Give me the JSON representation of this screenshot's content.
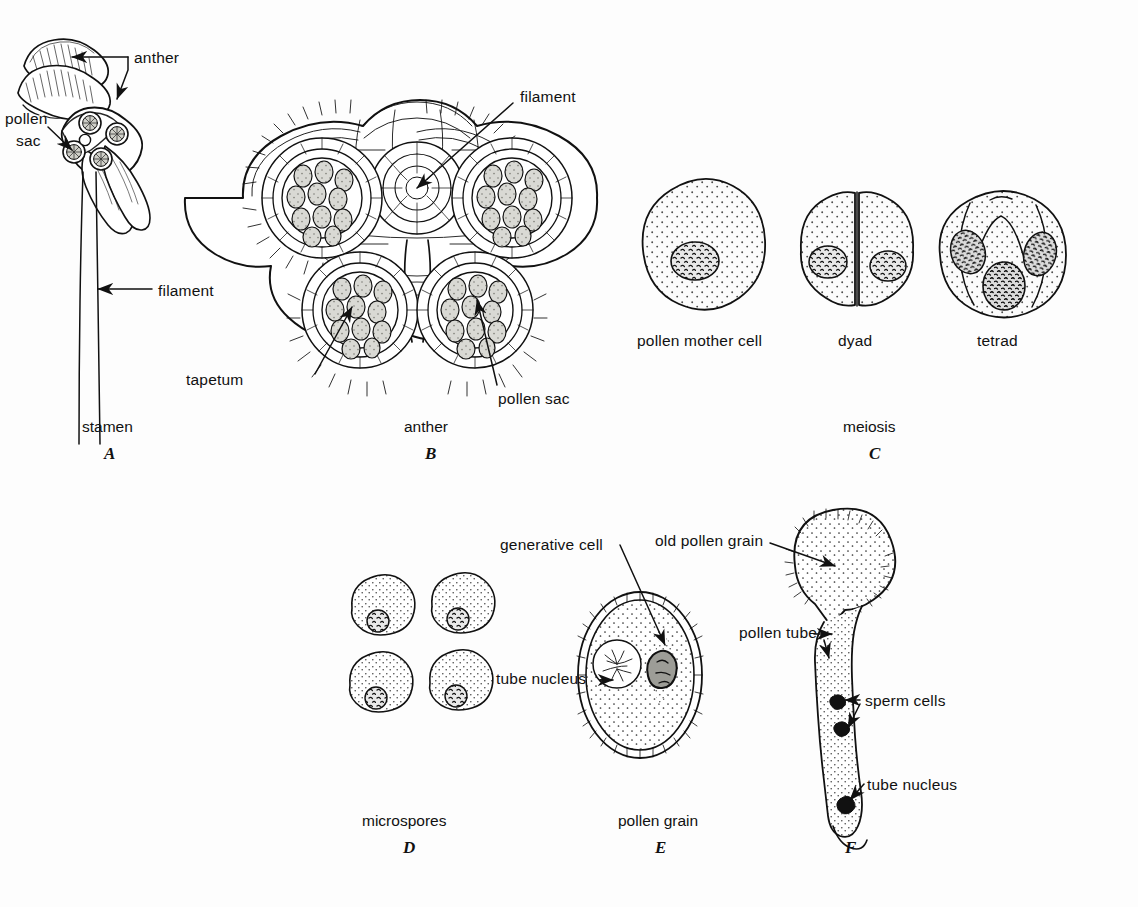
{
  "figure": {
    "background": "#fdfdfd",
    "ink": "#111111",
    "title_implied": "Microsporogenesis and pollen development in an angiosperm",
    "width": 1138,
    "height": 907
  },
  "panels": [
    {
      "id": "A",
      "letter": "A",
      "caption": "stamen",
      "caption_pos": {
        "x": 82,
        "y": 418
      },
      "letter_pos": {
        "x": 104,
        "y": 446
      },
      "callouts": [
        {
          "name": "anther",
          "text": "anther",
          "x": 134,
          "y": 49
        },
        {
          "name": "pollen-sac",
          "text": "pollen",
          "x": 5,
          "y": 110
        },
        {
          "name": "pollen-sac-2",
          "text": "sac",
          "x": 16,
          "y": 130
        },
        {
          "name": "filament",
          "text": "filament",
          "x": 158,
          "y": 282
        }
      ]
    },
    {
      "id": "B",
      "letter": "B",
      "caption": "anther",
      "caption_pos": {
        "x": 404,
        "y": 418
      },
      "letter_pos": {
        "x": 425,
        "y": 446
      },
      "callouts": [
        {
          "name": "filament",
          "text": "filament",
          "x": 520,
          "y": 88
        },
        {
          "name": "tapetum",
          "text": "tapetum",
          "x": 259,
          "y": 378
        },
        {
          "name": "pollen-sac",
          "text": "pollen sac",
          "x": 500,
          "y": 391
        }
      ]
    },
    {
      "id": "C",
      "letter": "C",
      "caption": "meiosis",
      "caption_pos": {
        "x": 843,
        "y": 418
      },
      "letter_pos": {
        "x": 869,
        "y": 446
      },
      "stages": [
        {
          "name": "pollen-mother-cell",
          "label": "pollen mother cell",
          "x": 640,
          "y": 330
        },
        {
          "name": "dyad",
          "label": "dyad",
          "x": 838,
          "y": 330
        },
        {
          "name": "tetrad",
          "label": "tetrad",
          "x": 975,
          "y": 330
        }
      ]
    },
    {
      "id": "D",
      "letter": "D",
      "caption": "microspores",
      "caption_pos": {
        "x": 362,
        "y": 812
      },
      "letter_pos": {
        "x": 403,
        "y": 840
      },
      "callouts": []
    },
    {
      "id": "E",
      "letter": "E",
      "caption": "pollen grain",
      "caption_pos": {
        "x": 618,
        "y": 812
      },
      "letter_pos": {
        "x": 655,
        "y": 840
      },
      "callouts": [
        {
          "name": "generative-cell",
          "text": "generative cell",
          "x": 500,
          "y": 536
        },
        {
          "name": "tube-nucleus",
          "text": "tube nucleus",
          "x": 496,
          "y": 673
        }
      ]
    },
    {
      "id": "F",
      "letter": "F",
      "caption": "",
      "caption_pos": {
        "x": 0,
        "y": 0
      },
      "letter_pos": {
        "x": 845,
        "y": 840
      },
      "callouts": [
        {
          "name": "old-pollen-grain",
          "text": "old pollen grain",
          "x": 655,
          "y": 535
        },
        {
          "name": "pollen-tube",
          "text": "pollen tube",
          "x": 739,
          "y": 627
        },
        {
          "name": "sperm-cells",
          "text": "sperm cells",
          "x": 865,
          "y": 696
        },
        {
          "name": "tube-nucleus",
          "text": "tube nucleus",
          "x": 867,
          "y": 780
        }
      ]
    }
  ],
  "structures": {
    "a_anther_whole": "anther side view, two fused lobes",
    "a_anther_cut": "anther with cut face showing four pollen sacs",
    "a_filament": "long slender stalk",
    "b_lobes": 4,
    "b_pollen_sacs": 4,
    "c_cells": 3,
    "d_microspores": 4,
    "e_grain": "oval pollen grain with tube nucleus and generative cell",
    "f_grain": "germinated pollen grain with long pollen tube, two sperm cells, tube nucleus"
  }
}
